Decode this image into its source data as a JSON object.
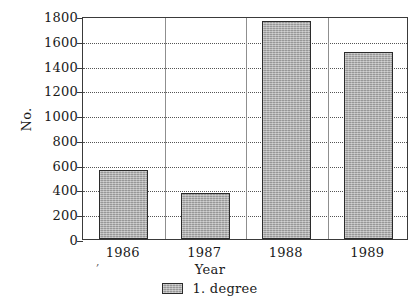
{
  "chart_data": {
    "type": "bar",
    "title": "",
    "subtitle": "",
    "xlabel": "Year",
    "ylabel": "No.",
    "categories": [
      "1986",
      "1987",
      "1988",
      "1989"
    ],
    "series": [
      {
        "name": "1. degree",
        "values": [
          560,
          370,
          1760,
          1510
        ]
      }
    ],
    "ylim": [
      0,
      1800
    ],
    "ytick_labels": [
      "0",
      "200",
      "400",
      "600",
      "800",
      "1000",
      "1200",
      "1400",
      "1600",
      "1800"
    ],
    "ytick_values": [
      0,
      200,
      400,
      600,
      800,
      1000,
      1200,
      1400,
      1600,
      1800
    ],
    "grid": "horizontal-dotted",
    "legend_position": "bottom-center",
    "bar_color": "#a9a9a9",
    "bar_edge_color": "#2b2b2b",
    "axis_color": "#3a3a3a",
    "gridline_color": "#555555",
    "separator_color": "#8f8f8f",
    "background": "#ffffff",
    "annotations": [
      {
        "name": "stray-comma-mark",
        "text": ","
      }
    ]
  },
  "legend": {
    "entries": [
      {
        "label": "1. degree",
        "swatch_name": "legend-swatch-1-degree"
      }
    ]
  }
}
